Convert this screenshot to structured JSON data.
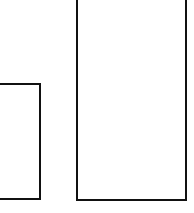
{
  "diagram": {
    "background": "#ffffff",
    "stroke_color": "#111111",
    "shapes": [
      {
        "id": "left-rectangle",
        "type": "rectangle",
        "left": -4,
        "top": 83,
        "width": 45,
        "height": 117
      },
      {
        "id": "right-rectangle",
        "type": "rectangle",
        "left": 76,
        "top": -4,
        "width": 111,
        "height": 205
      }
    ]
  }
}
